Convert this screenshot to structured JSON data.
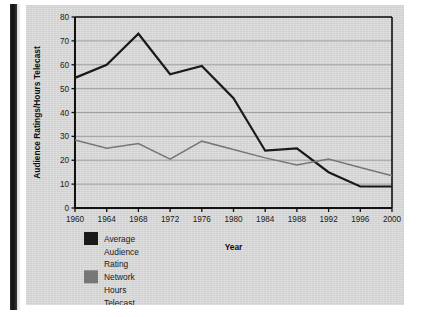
{
  "chart_data": {
    "type": "line",
    "title": "",
    "xlabel": "Year",
    "ylabel": "Audience Ratings/Hours Telecast",
    "x": [
      1960,
      1964,
      1968,
      1972,
      1976,
      1980,
      1984,
      1988,
      1992,
      1996,
      2000
    ],
    "categories": [
      "1960",
      "1964",
      "1968",
      "1972",
      "1976",
      "1980",
      "1984",
      "1988",
      "1992",
      "1996",
      "2000"
    ],
    "xlim": [
      1960,
      2000
    ],
    "ylim": [
      0,
      80
    ],
    "yticks": [
      0,
      10,
      20,
      30,
      40,
      50,
      60,
      70,
      80
    ],
    "ytick_labels": [
      "0",
      "10",
      "20",
      "30",
      "40",
      "50",
      "60",
      "70",
      "80"
    ],
    "grid": "horizontal",
    "legend_position": "below-axes-left",
    "series": [
      {
        "name": "Average Audience Rating",
        "legend_label_lines": [
          "Average",
          "Audience",
          "Rating"
        ],
        "color": "#1a1a1a",
        "values": [
          54.5,
          60.0,
          73.0,
          56.0,
          59.5,
          46.0,
          24.0,
          25.0,
          15.0,
          9.0,
          9.0
        ]
      },
      {
        "name": "Network Hours Telecast",
        "legend_label_lines": [
          "Network",
          "Hours",
          "Telecast"
        ],
        "color": "#777777",
        "values": [
          28.5,
          25.0,
          27.0,
          20.5,
          28.0,
          24.5,
          21.0,
          18.0,
          20.5,
          17.0,
          13.5
        ]
      }
    ]
  },
  "colors": {
    "panel_background": "#dcdcdc",
    "axis": "#111111",
    "gridline": "#9a9a9a",
    "series_black": "#1a1a1a",
    "series_gray": "#777777"
  }
}
